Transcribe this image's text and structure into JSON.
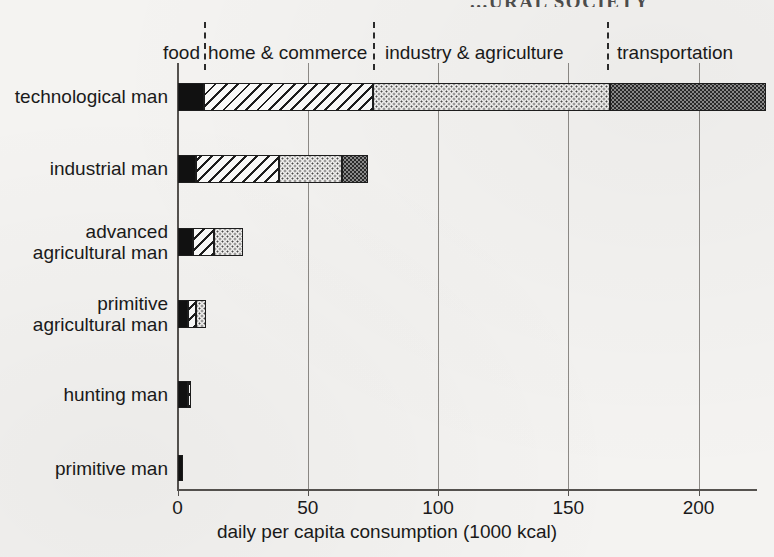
{
  "title_partial": "...URAL SOCIETY",
  "chart_data": {
    "type": "bar",
    "orientation": "horizontal",
    "stacked": true,
    "title": "",
    "xlabel": "daily per capita consumption (1000 kcal)",
    "ylabel": "",
    "xlim": [
      0,
      228
    ],
    "xticks": [
      0,
      50,
      100,
      150,
      200
    ],
    "xticklabels": [
      "0",
      "50",
      "100",
      "150",
      "200"
    ],
    "grid": "vertical",
    "legend_position": "top-inline",
    "categories": [
      "technological man",
      "industrial man",
      "advanced\nagricultural man",
      "primitive\nagricultural man",
      "hunting man",
      "primitive man"
    ],
    "series": [
      {
        "name": "food",
        "pattern": "solid-black",
        "values": [
          10,
          7,
          6,
          4,
          4,
          2
        ]
      },
      {
        "name": "home & commerce",
        "pattern": "diagonal-hatch",
        "values": [
          65,
          32,
          8,
          3,
          1,
          0
        ]
      },
      {
        "name": "industry & agriculture",
        "pattern": "fine-dots",
        "values": [
          91,
          24,
          11,
          4,
          0,
          0
        ]
      },
      {
        "name": "transportation",
        "pattern": "dense-dots-gray",
        "values": [
          60,
          10,
          0,
          0,
          0,
          0
        ]
      }
    ],
    "totals": [
      226,
      73,
      25,
      11,
      5,
      2
    ],
    "segment_dividers": [
      10,
      75,
      165
    ],
    "annotations": [
      {
        "label": "food",
        "x_center": 6
      },
      {
        "label": "home & commerce",
        "x_center": 42
      },
      {
        "label": "industry  &  agriculture",
        "x_center": 120
      },
      {
        "label": "transportation",
        "x_center": 196
      }
    ]
  },
  "axis": {
    "x_title": "daily per capita consumption (1000 kcal)",
    "ticks": [
      {
        "label": "0",
        "value": 0
      },
      {
        "label": "50",
        "value": 50
      },
      {
        "label": "100",
        "value": 100
      },
      {
        "label": "150",
        "value": 150
      },
      {
        "label": "200",
        "value": 200
      }
    ]
  },
  "category_headers": [
    {
      "label": "food"
    },
    {
      "label": "home & commerce"
    },
    {
      "label": "industry  &  agriculture"
    },
    {
      "label": "transportation"
    }
  ],
  "rows": [
    {
      "label": "technological man"
    },
    {
      "label": "industrial man"
    },
    {
      "label": "advanced\nagricultural man"
    },
    {
      "label": "primitive\nagricultural man"
    },
    {
      "label": "hunting man"
    },
    {
      "label": "primitive man"
    }
  ]
}
